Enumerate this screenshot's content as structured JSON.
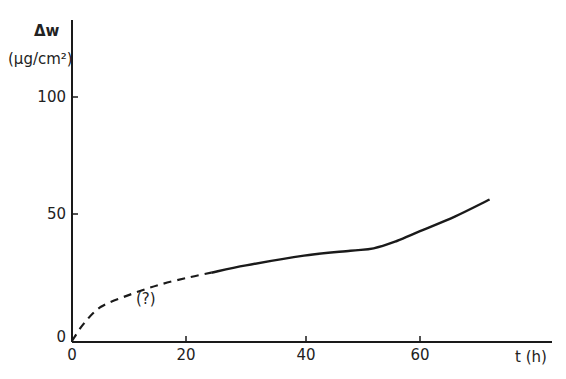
{
  "chart_data": {
    "type": "line",
    "title": "",
    "ylabel_line1": "Δw",
    "ylabel_line2": "(μg/cm²)",
    "xlabel": "t (h)",
    "xlim": [
      0,
      76
    ],
    "ylim": [
      0,
      110
    ],
    "x_ticks": [
      "0",
      "20",
      "40",
      "60"
    ],
    "y_ticks": [
      "0",
      "50",
      "100"
    ],
    "grid": false,
    "annotation": "(?)",
    "series": [
      {
        "name": "uncertain (dashed)",
        "style": "dashed",
        "x": [
          0,
          2,
          5,
          10,
          15,
          20,
          24
        ],
        "y": [
          0,
          7,
          14,
          19,
          23,
          26,
          28
        ]
      },
      {
        "name": "measured (solid)",
        "style": "solid",
        "x": [
          24,
          30,
          40,
          48,
          52,
          56,
          60,
          66,
          72
        ],
        "y": [
          28,
          31,
          35,
          37,
          38,
          41,
          45,
          51,
          58
        ]
      }
    ]
  }
}
